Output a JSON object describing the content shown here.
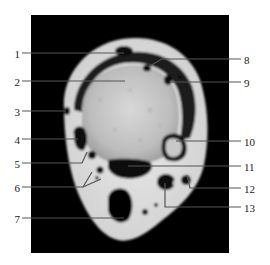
{
  "figure": {
    "panel": {
      "x": 31,
      "y": 15,
      "width": 198,
      "height": 238,
      "color": "#000000"
    },
    "line_color": "#555555",
    "labels": [
      {
        "id": "1",
        "text": "1",
        "side": "left",
        "tx": 8,
        "ty": 49,
        "line": [
          [
            22,
            53
          ],
          [
            124,
            53
          ]
        ]
      },
      {
        "id": "2",
        "text": "2",
        "side": "left",
        "tx": 8,
        "ty": 77,
        "line": [
          [
            22,
            81
          ],
          [
            125,
            81
          ]
        ]
      },
      {
        "id": "3",
        "text": "3",
        "side": "left",
        "tx": 8,
        "ty": 107,
        "line": [
          [
            22,
            111
          ],
          [
            66,
            111
          ]
        ]
      },
      {
        "id": "4",
        "text": "4",
        "side": "left",
        "tx": 8,
        "ty": 135,
        "line": [
          [
            22,
            139
          ],
          [
            78,
            139
          ]
        ]
      },
      {
        "id": "5",
        "text": "5",
        "side": "left",
        "tx": 8,
        "ty": 159,
        "line": [
          [
            22,
            163
          ],
          [
            82,
            163
          ],
          [
            87,
            152
          ]
        ]
      },
      {
        "id": "6",
        "text": "6",
        "side": "left",
        "tx": 8,
        "ty": 183,
        "line": [
          [
            22,
            187
          ],
          [
            83,
            187
          ],
          [
            92,
            172
          ]
        ]
      },
      {
        "id": "6b",
        "text": "",
        "side": "none",
        "tx": 0,
        "ty": 0,
        "line": [
          [
            83,
            187
          ],
          [
            101,
            179
          ]
        ]
      },
      {
        "id": "7",
        "text": "7",
        "side": "left",
        "tx": 8,
        "ty": 214,
        "line": [
          [
            22,
            218
          ],
          [
            124,
            218
          ]
        ]
      },
      {
        "id": "8",
        "text": "8",
        "side": "right",
        "tx": 244,
        "ty": 55,
        "line": [
          [
            148,
            67
          ],
          [
            162,
            59
          ],
          [
            241,
            59
          ]
        ]
      },
      {
        "id": "9",
        "text": "9",
        "side": "right",
        "tx": 244,
        "ty": 78,
        "line": [
          [
            170,
            82
          ],
          [
            241,
            82
          ]
        ]
      },
      {
        "id": "10",
        "text": "10",
        "side": "right",
        "tx": 244,
        "ty": 137,
        "line": [
          [
            176,
            141
          ],
          [
            241,
            141
          ]
        ]
      },
      {
        "id": "11",
        "text": "11",
        "side": "right",
        "tx": 244,
        "ty": 162,
        "line": [
          [
            128,
            166
          ],
          [
            241,
            166
          ]
        ]
      },
      {
        "id": "12",
        "text": "12",
        "side": "right",
        "tx": 244,
        "ty": 184,
        "line": [
          [
            187,
            175
          ],
          [
            190,
            188
          ],
          [
            241,
            188
          ]
        ]
      },
      {
        "id": "13",
        "text": "13",
        "side": "right",
        "tx": 244,
        "ty": 203,
        "line": [
          [
            165,
            183
          ],
          [
            165,
            207
          ],
          [
            241,
            207
          ]
        ]
      }
    ]
  }
}
